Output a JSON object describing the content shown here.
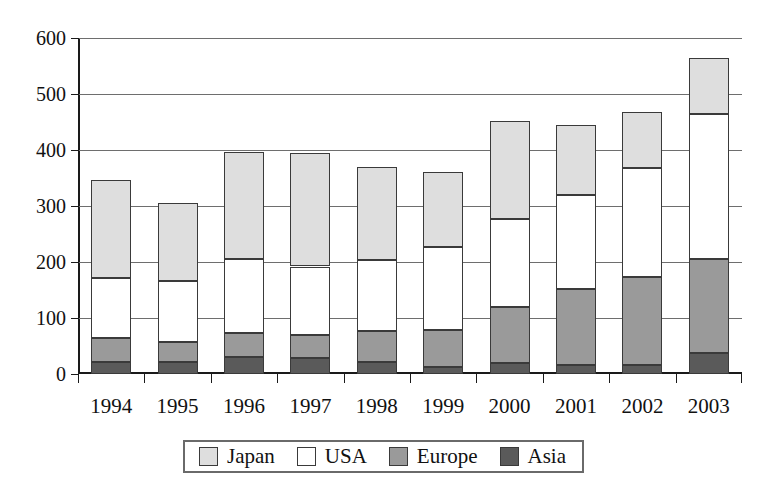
{
  "chart_data": {
    "type": "bar",
    "stacked": true,
    "title": "",
    "xlabel": "",
    "ylabel": "",
    "categories": [
      "1994",
      "1995",
      "1996",
      "1997",
      "1998",
      "1999",
      "2000",
      "2001",
      "2002",
      "2003"
    ],
    "series": [
      {
        "name": "Asia",
        "color": "#5a5a5a",
        "values": [
          21,
          21,
          30,
          29,
          21,
          13,
          20,
          16,
          16,
          37
        ]
      },
      {
        "name": "Europe",
        "color": "#9a9a9a",
        "values": [
          64,
          58,
          74,
          69,
          76,
          79,
          120,
          151,
          174,
          206
        ]
      },
      {
        "name": "USA",
        "color": "#ffffff",
        "values": [
          172,
          166,
          206,
          192,
          204,
          226,
          277,
          320,
          368,
          465
        ]
      },
      {
        "name": "Japan",
        "color": "#dedede",
        "values": [
          346,
          305,
          396,
          395,
          369,
          360,
          452,
          445,
          467,
          564
        ]
      }
    ],
    "stack_tops": {
      "Asia": [
        21,
        21,
        30,
        29,
        21,
        13,
        20,
        16,
        16,
        37
      ],
      "Europe": [
        64,
        58,
        74,
        69,
        76,
        79,
        120,
        151,
        174,
        206
      ],
      "USA": [
        172,
        166,
        206,
        192,
        204,
        226,
        277,
        320,
        368,
        465
      ],
      "Japan": [
        346,
        305,
        396,
        395,
        369,
        360,
        452,
        445,
        467,
        564
      ]
    },
    "ylim": [
      0,
      600
    ],
    "yticks": [
      0,
      100,
      200,
      300,
      400,
      500,
      600
    ],
    "ytick_labels": [
      "0",
      "100",
      "200",
      "300",
      "400",
      "500",
      "600"
    ],
    "grid": true,
    "legend_position": "bottom",
    "legend_entries": [
      {
        "label": "Japan",
        "color": "#dedede"
      },
      {
        "label": "USA",
        "color": "#ffffff"
      },
      {
        "label": "Europe",
        "color": "#9a9a9a"
      },
      {
        "label": "Asia",
        "color": "#5a5a5a"
      }
    ]
  }
}
